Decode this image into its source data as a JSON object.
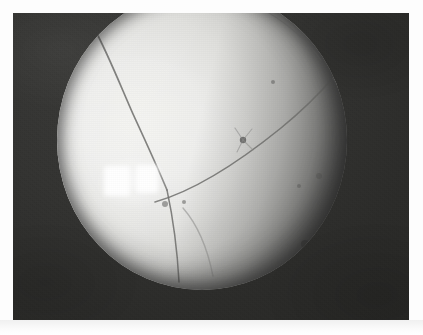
{
  "image": {
    "kind": "photograph",
    "modality_label": "grayscale endoscopic / close-up photograph",
    "subject_label": "bright spherical specimen with crack lines",
    "alt_text": "Grayscale close-up photograph showing a large pale spherical object filling a circular field of view, with dark branching crack lines, a bright rectangular specular highlight on the left, and small dark specks; surrounded by a dark rectangular background and a white page margin.",
    "has_visible_text": false,
    "caption": ""
  },
  "frame": {
    "background_color": "#2e2e2e",
    "left": 13,
    "top": 13,
    "width": 396,
    "height": 307,
    "page_margin_color": "#ffffff"
  },
  "specimen": {
    "shape": "circle",
    "center_x": 202,
    "center_y": 140,
    "radius_x": 145,
    "radius_y": 150,
    "highlight_color": "#f4f4f0",
    "midtone_color": "#d4d4d1",
    "shadow_color": "#6a6a68",
    "clipped_edges": [
      "top"
    ]
  },
  "specular_highlight": {
    "label": "light source reflection",
    "patch_count": 2,
    "color": "#ffffff",
    "patches": [
      {
        "x": 47,
        "y": 176,
        "w": 26,
        "h": 30
      },
      {
        "x": 79,
        "y": 175,
        "w": 22,
        "h": 28
      }
    ]
  },
  "features": {
    "crack_lines": [
      {
        "name": "upper-arc-crack",
        "path": "M 38 40 C 70 14, 120 4, 176 8 C 214 12, 244 26, 262 46"
      },
      {
        "name": "left-branch-crack",
        "path": "M 38 40 C 50 62, 62 92, 76 124 C 88 150, 100 176, 110 200"
      },
      {
        "name": "long-vertical-crack",
        "path": "M 110 200 C 116 228, 120 254, 122 288"
      },
      {
        "name": "diagonal-crack",
        "path": "M 98 210 C 140 198, 182 172, 224 138 C 246 120, 262 104, 276 88"
      },
      {
        "name": "right-arc-crack",
        "path": "M 276 88 C 288 104, 292 124, 290 146"
      },
      {
        "name": "lower-y-branch",
        "path": "M 126 216 C 140 232, 150 254, 156 282"
      }
    ],
    "specks": [
      {
        "name": "starburst-speck",
        "x": 186,
        "y": 150,
        "r": 5
      },
      {
        "name": "speck-a",
        "x": 108,
        "y": 214,
        "r": 3
      },
      {
        "name": "speck-b",
        "x": 127,
        "y": 212,
        "r": 2
      },
      {
        "name": "speck-c",
        "x": 262,
        "y": 186,
        "r": 3
      },
      {
        "name": "speck-d",
        "x": 248,
        "y": 254,
        "r": 4
      },
      {
        "name": "speck-e",
        "x": 270,
        "y": 246,
        "r": 2
      },
      {
        "name": "speck-f",
        "x": 216,
        "y": 92,
        "r": 2
      }
    ]
  }
}
